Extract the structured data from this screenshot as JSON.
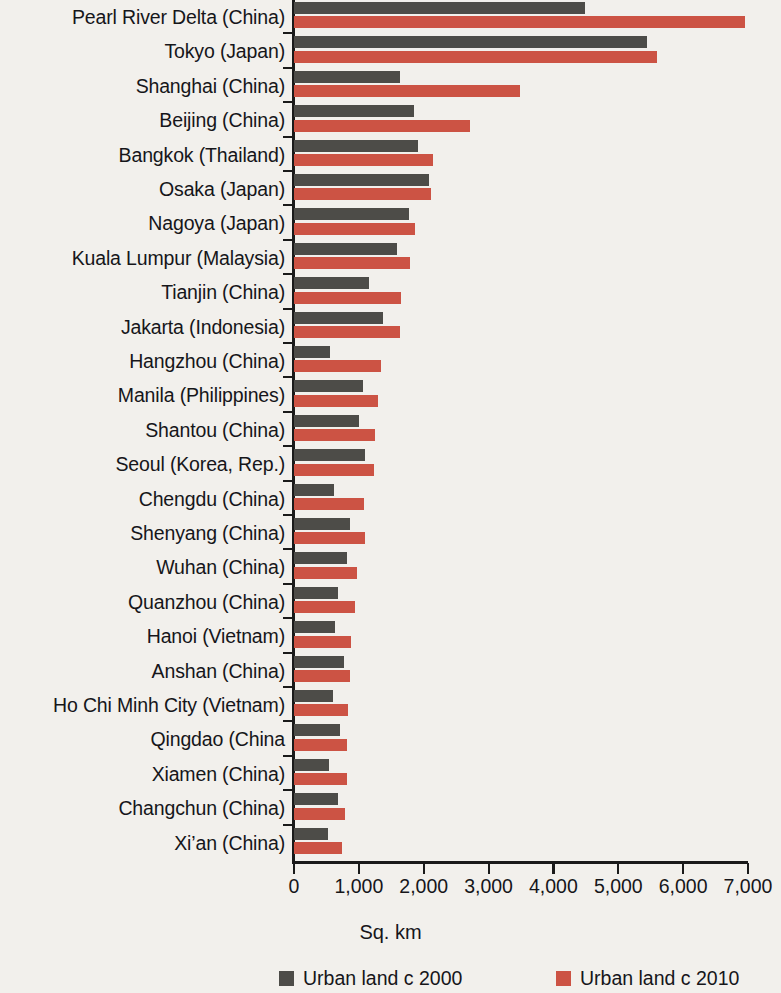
{
  "chart_data": {
    "type": "bar",
    "orientation": "horizontal",
    "title": "",
    "subtitle": "",
    "xlabel": "Sq. km",
    "ylabel": "",
    "xlim": [
      0,
      7000
    ],
    "xticks": [
      0,
      1000,
      2000,
      3000,
      4000,
      5000,
      6000,
      7000
    ],
    "xtick_labels": [
      "0",
      "1,000",
      "2,000",
      "3,000",
      "4,000",
      "5,000",
      "6,000",
      "7,000"
    ],
    "grid": false,
    "legend_position": "bottom",
    "categories": [
      "Pearl River Delta (China)",
      "Tokyo (Japan)",
      "Shanghai (China)",
      "Beijing (China)",
      "Bangkok (Thailand)",
      "Osaka (Japan)",
      "Nagoya (Japan)",
      "Kuala Lumpur (Malaysia)",
      "Tianjin (China)",
      "Jakarta (Indonesia)",
      "Hangzhou (China)",
      "Manila (Philippines)",
      "Shantou (China)",
      "Seoul (Korea, Rep.)",
      "Chengdu (China)",
      "Shenyang (China)",
      "Wuhan (China)",
      "Quanzhou (China)",
      "Hanoi (Vietnam)",
      "Anshan (China)",
      "Ho Chi Minh City (Vietnam)",
      "Qingdao (China",
      "Xiamen (China)",
      "Changchun (China)",
      "Xi’an (China)"
    ],
    "series": [
      {
        "name": "Urban land c 2000",
        "color": "#4d4c48",
        "values": [
          4490,
          5450,
          1630,
          1850,
          1910,
          2080,
          1770,
          1590,
          1150,
          1370,
          550,
          1060,
          1000,
          1090,
          620,
          860,
          820,
          680,
          630,
          770,
          600,
          710,
          540,
          680,
          520
        ]
      },
      {
        "name": "Urban land c 2010",
        "color": "#cc5344",
        "values": [
          6950,
          5590,
          3480,
          2710,
          2150,
          2110,
          1860,
          1790,
          1650,
          1630,
          1340,
          1290,
          1250,
          1230,
          1080,
          1090,
          970,
          940,
          880,
          860,
          830,
          820,
          820,
          790,
          740
        ]
      }
    ]
  },
  "axis": {
    "x_title": "Sq. km"
  },
  "legend": {
    "items": [
      {
        "label": "Urban land c 2000",
        "color": "#4d4c48"
      },
      {
        "label": "Urban land c 2010",
        "color": "#cc5344"
      }
    ]
  },
  "colors": {
    "series_2000": "#4d4c48",
    "series_2010": "#cc5344",
    "background": "#f2f0ec",
    "axis": "#1a1a1a"
  }
}
